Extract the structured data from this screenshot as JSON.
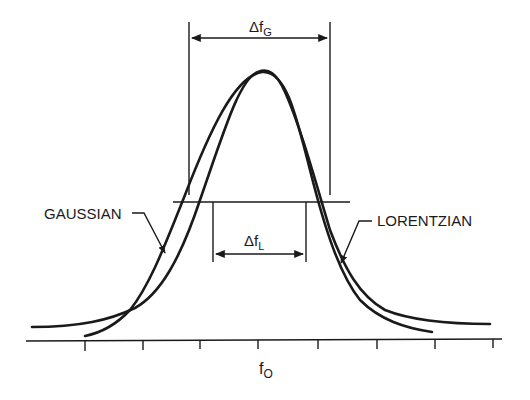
{
  "diagram": {
    "title": "",
    "labels": {
      "gaussian": "GAUSSIAN",
      "lorentzian": "LORENTZIAN",
      "delta_fg_main": "Δf",
      "delta_fg_sub": "G",
      "delta_fl_main": "Δf",
      "delta_fl_sub": "L",
      "f0_main": "f",
      "f0_sub": "O"
    },
    "colors": {
      "ink": "#1a1a1a",
      "background": "#ffffff"
    },
    "curves": [
      {
        "name": "Gaussian",
        "shape": "narrow tails, wider near half-maximum"
      },
      {
        "name": "Lorentzian",
        "shape": "long tails, narrower near half-maximum"
      }
    ],
    "axis": {
      "center_label": "fO",
      "tick_count": 8
    }
  }
}
